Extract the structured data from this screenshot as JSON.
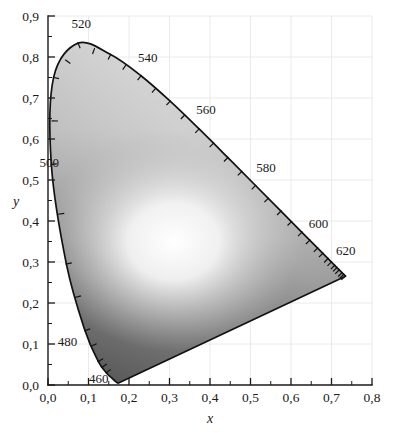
{
  "figure": {
    "background_color": "#ffffff",
    "ink_color": "#1a1a1a",
    "grid_color": "#e8e8e8"
  },
  "axes": {
    "x": {
      "label": "x",
      "tick_labels": [
        "0,0",
        "0,1",
        "0,2",
        "0,3",
        "0,4",
        "0,5",
        "0,6",
        "0,7",
        "0,8"
      ],
      "tick_values": [
        0.0,
        0.1,
        0.2,
        0.3,
        0.4,
        0.5,
        0.6,
        0.7,
        0.8
      ],
      "min": 0.0,
      "max": 0.8,
      "minor_step": 0.05
    },
    "y": {
      "label": "y",
      "tick_labels": [
        "0,0",
        "0,1",
        "0,2",
        "0,3",
        "0,4",
        "0,5",
        "0,6",
        "0,7",
        "0,8",
        "0,9"
      ],
      "tick_values": [
        0.0,
        0.1,
        0.2,
        0.3,
        0.4,
        0.5,
        0.6,
        0.7,
        0.8,
        0.9
      ],
      "min": 0.0,
      "max": 0.9,
      "minor_step": 0.05
    }
  },
  "wavelength_labels": [
    {
      "text": "460",
      "x": 0.125,
      "y": 0.018
    },
    {
      "text": "480",
      "x": 0.048,
      "y": 0.108
    },
    {
      "text": "500",
      "x": 0.003,
      "y": 0.545
    },
    {
      "text": "520",
      "x": 0.082,
      "y": 0.882
    },
    {
      "text": "540",
      "x": 0.246,
      "y": 0.8
    },
    {
      "text": "560",
      "x": 0.39,
      "y": 0.672
    },
    {
      "text": "580",
      "x": 0.538,
      "y": 0.532
    },
    {
      "text": "600",
      "x": 0.668,
      "y": 0.396
    },
    {
      "text": "620",
      "x": 0.735,
      "y": 0.33
    }
  ],
  "chart_data": {
    "type": "scatter",
    "xlabel": "x",
    "ylabel": "y",
    "xlim": [
      0.0,
      0.8
    ],
    "ylim": [
      0.0,
      0.9
    ],
    "grid": true,
    "legend": "none",
    "rendering": "grayscale gamut fill with spectral locus outline",
    "white_point": {
      "x": 0.31,
      "y": 0.35
    },
    "purple_line": {
      "from": [
        0.1741,
        0.005
      ],
      "to": [
        0.7347,
        0.2653
      ]
    },
    "spectral_locus": {
      "description": "CIE 1931 2-degree spectral locus, wavelength in nm",
      "wavelengths_nm": [
        380,
        390,
        400,
        410,
        420,
        430,
        440,
        450,
        460,
        470,
        480,
        490,
        500,
        510,
        520,
        530,
        540,
        550,
        560,
        570,
        580,
        590,
        600,
        610,
        620,
        630,
        640,
        650,
        660,
        680,
        700
      ],
      "x": [
        0.1741,
        0.1738,
        0.1733,
        0.1726,
        0.1714,
        0.1689,
        0.1644,
        0.1566,
        0.144,
        0.1241,
        0.0913,
        0.0454,
        0.0082,
        0.0139,
        0.0743,
        0.1547,
        0.2296,
        0.3016,
        0.3731,
        0.4441,
        0.5125,
        0.5752,
        0.627,
        0.6658,
        0.6915,
        0.7079,
        0.719,
        0.726,
        0.73,
        0.734,
        0.7347
      ],
      "y": [
        0.005,
        0.0049,
        0.0048,
        0.0048,
        0.0051,
        0.0069,
        0.0109,
        0.0177,
        0.0297,
        0.0578,
        0.1327,
        0.295,
        0.5384,
        0.7502,
        0.8338,
        0.8059,
        0.7543,
        0.6923,
        0.6245,
        0.5547,
        0.4866,
        0.4242,
        0.3725,
        0.334,
        0.3083,
        0.292,
        0.2809,
        0.274,
        0.27,
        0.266,
        0.2653
      ]
    },
    "wavelength_tick_marks_nm": [
      460,
      465,
      470,
      475,
      480,
      485,
      490,
      495,
      500,
      505,
      510,
      515,
      520,
      525,
      530,
      535,
      540,
      545,
      550,
      555,
      560,
      565,
      570,
      575,
      580,
      585,
      590,
      595,
      600,
      605,
      610,
      615,
      620,
      625,
      630,
      635,
      640,
      650,
      660,
      680
    ]
  }
}
